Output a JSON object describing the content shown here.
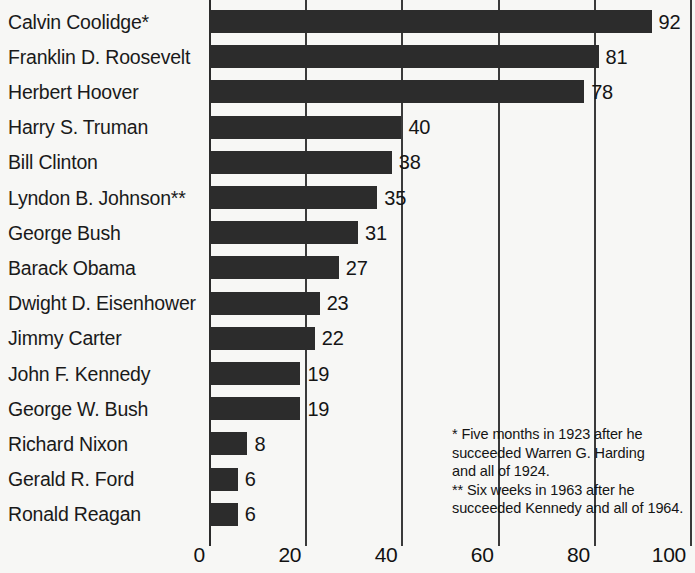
{
  "chart_data": {
    "type": "bar",
    "orientation": "horizontal",
    "title": "",
    "xlabel": "",
    "ylabel": "",
    "xlim": [
      0,
      100
    ],
    "xticks": [
      0,
      20,
      40,
      60,
      80,
      100
    ],
    "xtick_labels": [
      "0",
      "20",
      "40",
      "60",
      "80",
      "100"
    ],
    "grid": true,
    "legend": false,
    "categories": [
      "Calvin Coolidge*",
      "Franklin D. Roosevelt",
      "Herbert Hoover",
      "Harry S. Truman",
      "Bill Clinton",
      "Lyndon B. Johnson**",
      "George Bush",
      "Barack Obama",
      "Dwight D. Eisenhower",
      "Jimmy Carter",
      "John F. Kennedy",
      "George W. Bush",
      "Richard Nixon",
      "Gerald R. Ford",
      "Ronald Reagan"
    ],
    "values": [
      92,
      81,
      78,
      40,
      38,
      35,
      31,
      27,
      23,
      22,
      19,
      19,
      8,
      6,
      6
    ],
    "value_labels": [
      "92",
      "81",
      "78",
      "40",
      "38",
      "35",
      "31",
      "27",
      "23",
      "22",
      "19",
      "19",
      "8",
      "6",
      "6"
    ],
    "bar_color": "#2c2c2c",
    "background_color": "#f7f7f5",
    "annotations": [
      "* Five months in 1923 after he\nsucceeded Warren G. Harding\nand all of 1924.",
      "** Six weeks in 1963 after he\nsucceeded Kennedy and all of 1964."
    ]
  },
  "rows": [
    {
      "label": "Calvin Coolidge*",
      "value": 92,
      "value_label": "92"
    },
    {
      "label": "Franklin D. Roosevelt",
      "value": 81,
      "value_label": "81"
    },
    {
      "label": "Herbert Hoover",
      "value": 78,
      "value_label": "78"
    },
    {
      "label": "Harry S. Truman",
      "value": 40,
      "value_label": "40"
    },
    {
      "label": "Bill Clinton",
      "value": 38,
      "value_label": "38"
    },
    {
      "label": "Lyndon B. Johnson**",
      "value": 35,
      "value_label": "35"
    },
    {
      "label": "George Bush",
      "value": 31,
      "value_label": "31"
    },
    {
      "label": "Barack Obama",
      "value": 27,
      "value_label": "27"
    },
    {
      "label": "Dwight D. Eisenhower",
      "value": 23,
      "value_label": "23"
    },
    {
      "label": "Jimmy Carter",
      "value": 22,
      "value_label": "22"
    },
    {
      "label": "John F. Kennedy",
      "value": 19,
      "value_label": "19"
    },
    {
      "label": "George W. Bush",
      "value": 19,
      "value_label": "19"
    },
    {
      "label": "Richard Nixon",
      "value": 8,
      "value_label": "8"
    },
    {
      "label": "Gerald R. Ford",
      "value": 6,
      "value_label": "6"
    },
    {
      "label": "Ronald Reagan",
      "value": 6,
      "value_label": "6"
    }
  ],
  "xaxis": {
    "ticks": [
      {
        "value": 0,
        "label": "0"
      },
      {
        "value": 20,
        "label": "20"
      },
      {
        "value": 40,
        "label": "40"
      },
      {
        "value": 60,
        "label": "60"
      },
      {
        "value": 80,
        "label": "80"
      },
      {
        "value": 100,
        "label": "100"
      }
    ]
  },
  "footnotes": [
    {
      "text": "* Five months in 1923 after he\nsucceeded Warren G. Harding\nand all of 1924."
    },
    {
      "text": "** Six weeks in 1963 after he\nsucceeded Kennedy and all of 1964."
    }
  ],
  "colors": {
    "bar": "#2c2c2c",
    "grid": "#3a3a3a",
    "text": "#151515",
    "background": "#f7f7f5"
  }
}
